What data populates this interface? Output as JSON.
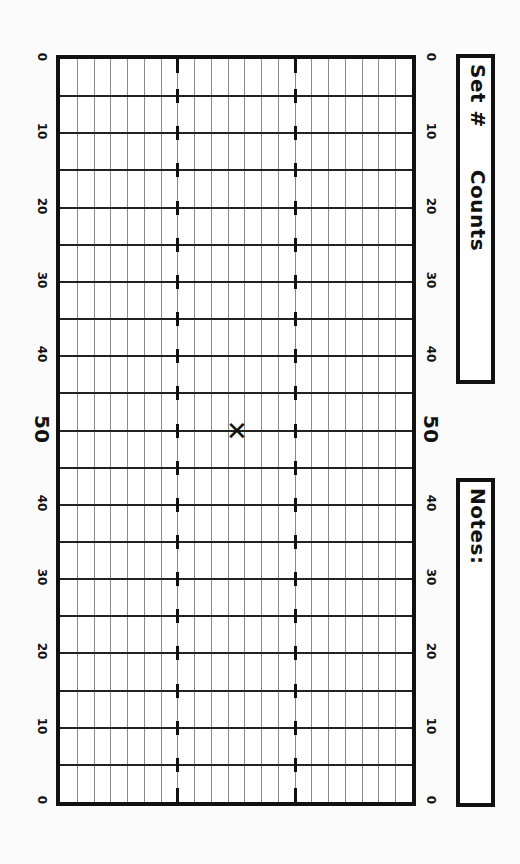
{
  "header": {
    "set_label": "Set #",
    "counts_label": "Counts",
    "notes_label": "Notes:"
  },
  "field": {
    "yard_labels": [
      "0",
      "10",
      "20",
      "30",
      "40",
      "50",
      "40",
      "30",
      "20",
      "10",
      "0"
    ],
    "hash_columns": [
      7,
      14
    ],
    "column_count": 21,
    "five_yard_rows": 20,
    "marker": {
      "symbol": "✕",
      "yard_line": "50",
      "description": "center X mark"
    }
  },
  "colors": {
    "border": "#111111",
    "yard_line": "#222222",
    "grid_line": "#8a8a8a",
    "background": "#ffffff"
  },
  "chart_data": {
    "type": "table",
    "xlabel": "Yard lines",
    "ylabel": "",
    "x": [
      "0",
      "5",
      "10",
      "15",
      "20",
      "25",
      "30",
      "35",
      "40",
      "45",
      "50",
      "45",
      "40",
      "35",
      "30",
      "25",
      "20",
      "15",
      "10",
      "5",
      "0"
    ],
    "yard_labels_left": [
      "0",
      "10",
      "20",
      "30",
      "40",
      "50",
      "40",
      "30",
      "20",
      "10",
      "0"
    ],
    "yard_labels_right": [
      "0",
      "10",
      "20",
      "30",
      "40",
      "50",
      "40",
      "30",
      "20",
      "10",
      "0"
    ],
    "hash_marks": [
      "front hash",
      "back hash"
    ],
    "points": [
      {
        "label": "X",
        "yard": 50,
        "position": "between hashes"
      }
    ],
    "grid": true
  }
}
